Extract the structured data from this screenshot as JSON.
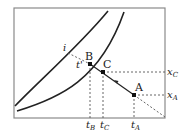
{
  "diagram": {
    "type": "psychrometric-process-diagram",
    "curves": [
      {
        "name": "upper-curve",
        "description": "saturation / equilibrium curve (left)"
      },
      {
        "name": "lower-curve",
        "description": "second curve (right)"
      }
    ],
    "points": {
      "A": {
        "label": "A"
      },
      "B": {
        "label": "B"
      },
      "C": {
        "label": "C"
      }
    },
    "labels": {
      "i": "i",
      "t_prime": "t'",
      "x_C": "x",
      "x_C_sub": "C",
      "x_A": "x",
      "x_A_sub": "A",
      "t_B": "t",
      "t_B_sub": "B",
      "t_C": "t",
      "t_C_sub": "C",
      "t_A": "t",
      "t_A_sub": "A"
    },
    "colors": {
      "line": "#222222",
      "frame": "#888888",
      "dashed": "#555555"
    }
  }
}
